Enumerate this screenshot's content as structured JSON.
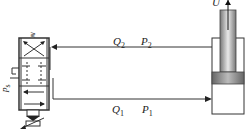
{
  "diagram": {
    "type": "hydraulic-circuit",
    "components": {
      "valve": {
        "name": "servo valve (directional control)",
        "ports_label": "p_s"
      },
      "cylinder": {
        "name": "hydraulic cylinder",
        "velocity_label": "U"
      }
    },
    "lines": {
      "return": {
        "flow": "Q",
        "flow_sub": "2",
        "pressure": "P",
        "pressure_sub": "2",
        "direction": "to-valve"
      },
      "supply": {
        "flow": "Q",
        "flow_sub": "1",
        "pressure": "P",
        "pressure_sub": "1",
        "direction": "to-cylinder"
      }
    },
    "labels": {
      "velocity": "U",
      "supply_pressure": "p",
      "supply_pressure_sub": "s"
    },
    "colors": {
      "line": "#333333",
      "piston_fill": "#888888",
      "rod_fill": "#aaaaaa"
    }
  }
}
